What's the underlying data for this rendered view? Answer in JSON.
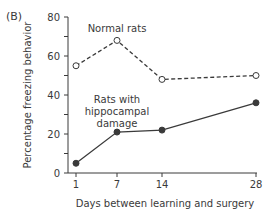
{
  "panel_label": "(B)",
  "chart_data": {
    "type": "line",
    "title": "",
    "xlabel": "Days between learning and surgery",
    "ylabel": "Percentage freezing behavior",
    "x": [
      1,
      7,
      14,
      28
    ],
    "x_tick_labels": [
      "1",
      "7",
      "14",
      "28"
    ],
    "y_ticks": [
      0,
      20,
      40,
      60,
      80
    ],
    "y_tick_labels": [
      "0",
      "20",
      "40",
      "60",
      "80"
    ],
    "ylim": [
      0,
      80
    ],
    "xlim": [
      0,
      28
    ],
    "grid": false,
    "legend": "inline annotations",
    "series": [
      {
        "name": "Normal rats",
        "values": [
          55,
          68,
          48,
          50
        ],
        "style": "dashed",
        "marker": "open-circle",
        "annotation": [
          "Normal rats"
        ]
      },
      {
        "name": "Rats with hippocampal damage",
        "values": [
          5,
          21,
          22,
          36
        ],
        "style": "solid",
        "marker": "filled-circle",
        "annotation": [
          "Rats with",
          "hippocampal",
          "damage"
        ]
      }
    ]
  }
}
